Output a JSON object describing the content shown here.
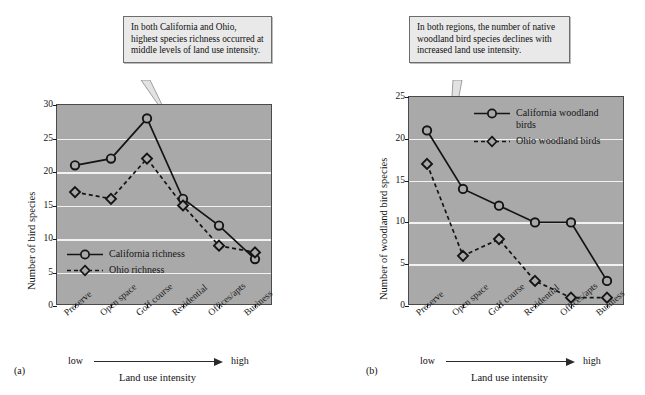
{
  "figure": {
    "categories": [
      "Preserve",
      "Open space",
      "Golf course",
      "Residential",
      "Offices/apts",
      "Business"
    ],
    "intensity_low": "low",
    "intensity_high": "high",
    "axis_title": "Land use intensity"
  },
  "panel_a": {
    "id": "(a)",
    "callout": "In both California and Ohio, highest species richness occurred at middle levels of land use intensity.",
    "legend": [
      {
        "label": "California richness",
        "marker": "circle",
        "style": "solid"
      },
      {
        "label": "Ohio richness",
        "marker": "diamond",
        "style": "dashed"
      }
    ],
    "chart_data": {
      "type": "line",
      "title": "",
      "xlabel": "Land use intensity",
      "ylabel": "Number of bird species",
      "categories": [
        "Preserve",
        "Open space",
        "Golf course",
        "Residential",
        "Offices/apts",
        "Business"
      ],
      "series": [
        {
          "name": "California richness",
          "values": [
            21,
            22,
            28,
            16,
            12,
            7
          ],
          "marker": "circle",
          "style": "solid"
        },
        {
          "name": "Ohio richness",
          "values": [
            17,
            16,
            22,
            15,
            9,
            8
          ],
          "marker": "diamond",
          "style": "dashed"
        }
      ],
      "ylim": [
        0,
        30
      ],
      "yticks": [
        0,
        5,
        10,
        15,
        20,
        25,
        30
      ],
      "grid": true,
      "legend_position": "inside-lower-left"
    }
  },
  "panel_b": {
    "id": "(b)",
    "callout": "In both regions, the number of native woodland bird species declines with increased land use intensity.",
    "legend": [
      {
        "label": "California woodland birds",
        "marker": "circle",
        "style": "solid"
      },
      {
        "label": "Ohio woodland birds",
        "marker": "diamond",
        "style": "dashed"
      }
    ],
    "chart_data": {
      "type": "line",
      "title": "",
      "xlabel": "Land use intensity",
      "ylabel": "Number of woodland bird species",
      "categories": [
        "Preserve",
        "Open space",
        "Golf course",
        "Residential",
        "Offices/apts",
        "Business"
      ],
      "series": [
        {
          "name": "California woodland birds",
          "values": [
            21,
            14,
            12,
            10,
            10,
            3
          ],
          "marker": "circle",
          "style": "solid"
        },
        {
          "name": "Ohio woodland birds",
          "values": [
            17,
            6,
            8,
            3,
            1,
            1
          ],
          "marker": "diamond",
          "style": "dashed"
        }
      ],
      "ylim": [
        0,
        25
      ],
      "yticks": [
        0,
        5,
        10,
        15,
        20,
        25
      ],
      "grid": true,
      "legend_position": "inside-upper-right"
    }
  },
  "colors": {
    "plot_background": "#a9a9a9",
    "gridline": "#f2f2f2",
    "line": "#141414",
    "callout_background": "#e9e9e9",
    "callout_border": "#6d6d6d"
  }
}
